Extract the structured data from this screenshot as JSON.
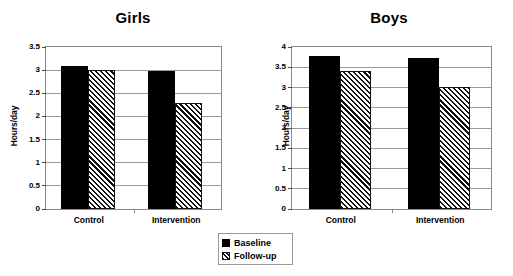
{
  "chart_data": [
    {
      "type": "bar",
      "title": "Girls",
      "xlabel": "",
      "ylabel": "Hours/day",
      "categories": [
        "Control",
        "Intervention"
      ],
      "series": [
        {
          "name": "Baseline",
          "values": [
            3.1,
            2.98
          ]
        },
        {
          "name": "Follow-up",
          "values": [
            3.0,
            2.28
          ]
        }
      ],
      "ylim": [
        0,
        3.5
      ],
      "ytick_step": 0.5,
      "yticks": [
        "0",
        "0.5",
        "1",
        "1.5",
        "2",
        "2.5",
        "3",
        "3.5"
      ],
      "grid": true,
      "legend_position": "bottom-center"
    },
    {
      "type": "bar",
      "title": "Boys",
      "xlabel": "",
      "ylabel": "Hours/day",
      "categories": [
        "Control",
        "Intervention"
      ],
      "series": [
        {
          "name": "Baseline",
          "values": [
            3.78,
            3.73
          ]
        },
        {
          "name": "Follow-up",
          "values": [
            3.42,
            3.02
          ]
        }
      ],
      "ylim": [
        0,
        4
      ],
      "ytick_step": 0.5,
      "yticks": [
        "0",
        "0.5",
        "1",
        "1.5",
        "2",
        "2.5",
        "3",
        "3.5",
        "4"
      ],
      "grid": true,
      "legend_position": "bottom-center"
    }
  ],
  "legend": {
    "items": [
      {
        "label": "Baseline",
        "swatch": "solid-black-square"
      },
      {
        "label": "Follow-up",
        "swatch": "hatched-square"
      }
    ]
  },
  "colors": {
    "baseline": "#000000",
    "followup_fill": "#ffffff",
    "followup_hatch": "#111111",
    "axis": "#8a8a8a",
    "gridline": "#9a9a9a",
    "text": "#000000"
  }
}
